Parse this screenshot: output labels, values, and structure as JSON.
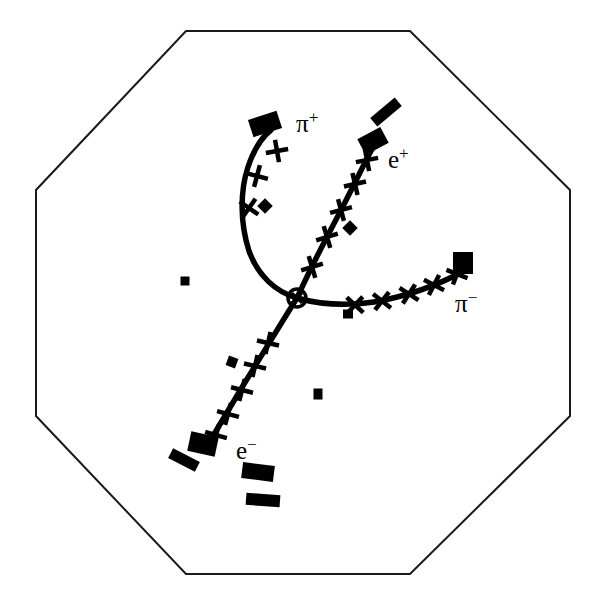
{
  "figure": {
    "kind": "particle-detector-event-display",
    "detector_shape": "octagon",
    "background_color": "#ffffff",
    "ink_color": "#000000",
    "outline_color": "#1a1a1a",
    "outline_width": 2
  },
  "detector": {
    "name": "octagonal-detector-outline",
    "vertices": [
      [
        186,
        31
      ],
      [
        410,
        31
      ],
      [
        570,
        190
      ],
      [
        570,
        416
      ],
      [
        410,
        574
      ],
      [
        186,
        574
      ],
      [
        36,
        416
      ],
      [
        36,
        190
      ]
    ]
  },
  "interaction_vertex": {
    "name": "interaction-vertex",
    "x": 297,
    "y": 298,
    "radius": 9,
    "inner_radius": 5
  },
  "tracks": [
    {
      "id": "pi-plus",
      "label": "π",
      "charge": "+",
      "label_x": 296,
      "label_y": 132,
      "curvature": "left",
      "path": "M 297 298 C 276 292 258 276 249 251 C 240 223 240 191 248 167 C 254 149 262 137 271 130",
      "hits": [
        [
          277,
          151
        ],
        [
          257,
          176
        ],
        [
          249,
          208
        ]
      ],
      "hit_angles": [
        35,
        60,
        80
      ],
      "endpoint_block": {
        "x": 265,
        "y": 124,
        "w": 30,
        "h": 18,
        "rot": -18
      }
    },
    {
      "id": "e-plus",
      "label": "e",
      "charge": "+",
      "label_x": 388,
      "label_y": 168,
      "curvature": "slight-right",
      "path": "M 297 298 C 307 276 322 246 339 214 C 352 189 363 166 372 149",
      "hits": [
        [
          312,
          267
        ],
        [
          327,
          237
        ],
        [
          341,
          210
        ],
        [
          355,
          184
        ],
        [
          367,
          160
        ]
      ],
      "hit_angles": [
        118,
        118,
        120,
        122,
        124
      ],
      "endpoint_block": {
        "x": 373,
        "y": 141,
        "w": 26,
        "h": 18,
        "rot": -28
      }
    },
    {
      "id": "pi-minus",
      "label": "π",
      "charge": "−",
      "label_x": 455,
      "label_y": 312,
      "curvature": "slight-up",
      "path": "M 297 298 C 322 305 348 306 374 302 C 408 296 440 284 464 271",
      "hits": [
        [
          355,
          305
        ],
        [
          382,
          301
        ],
        [
          409,
          294
        ],
        [
          434,
          285
        ],
        [
          457,
          274
        ]
      ],
      "hit_angles": [
        178,
        173,
        168,
        162,
        156
      ],
      "endpoint_block": {
        "x": 463,
        "y": 263,
        "w": 20,
        "h": 22,
        "rot": 0
      }
    },
    {
      "id": "e-minus",
      "label": "e",
      "charge": "−",
      "label_x": 236,
      "label_y": 459,
      "curvature": "straight",
      "path": "M 297 298 C 283 320 262 355 241 389 C 228 411 217 429 209 443",
      "hits": [
        [
          268,
          343
        ],
        [
          255,
          366
        ],
        [
          242,
          390
        ],
        [
          228,
          414
        ],
        [
          216,
          435
        ]
      ],
      "hit_angles": [
        58,
        58,
        59,
        60,
        61
      ],
      "endpoint_block": {
        "x": 203,
        "y": 444,
        "w": 28,
        "h": 20,
        "rot": 12
      }
    }
  ],
  "calorimeter_blocks": [
    {
      "name": "calo-bar-upper-right",
      "x": 386,
      "y": 112,
      "w": 32,
      "h": 11,
      "rot": -40
    },
    {
      "name": "calo-bar-lower-left-a",
      "x": 184,
      "y": 460,
      "w": 30,
      "h": 11,
      "rot": 27
    },
    {
      "name": "calo-bar-lower-center-a",
      "x": 258,
      "y": 472,
      "w": 32,
      "h": 16,
      "rot": 7
    },
    {
      "name": "calo-bar-lower-center-b",
      "x": 263,
      "y": 500,
      "w": 34,
      "h": 12,
      "rot": 4
    }
  ],
  "isolated_hits": [
    {
      "name": "isolated-hit-left",
      "x": 185,
      "y": 281,
      "w": 9,
      "h": 9,
      "rot": 0
    },
    {
      "name": "isolated-hit-bottom-center",
      "x": 318,
      "y": 394,
      "w": 9,
      "h": 11,
      "rot": 0
    },
    {
      "name": "isolated-hit-below-pi-minus",
      "x": 348,
      "y": 314,
      "w": 10,
      "h": 9,
      "rot": 0
    },
    {
      "name": "noise-hit-near-pi-plus",
      "x": 265,
      "y": 206,
      "w": 11,
      "h": 11,
      "rot": 45
    },
    {
      "name": "noise-hit-near-e-plus",
      "x": 350,
      "y": 228,
      "w": 11,
      "h": 11,
      "rot": 45
    },
    {
      "name": "noise-hit-near-e-minus",
      "x": 232,
      "y": 362,
      "w": 10,
      "h": 10,
      "rot": 20
    }
  ]
}
